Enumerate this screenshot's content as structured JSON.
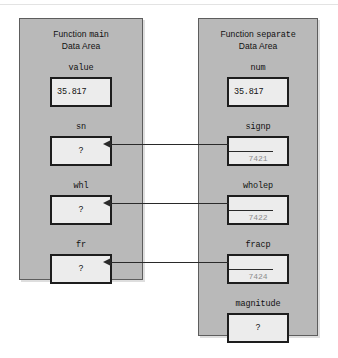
{
  "diagram": {
    "type": "memory-data-area-diagram",
    "panels": [
      {
        "id": "main",
        "title_line1_prefix": "Function ",
        "title_line1_name": "main",
        "title_line2": "Data Area",
        "variables": [
          {
            "name": "value",
            "value": "35.817",
            "address": "",
            "has_incoming_arrow": false
          },
          {
            "name": "sn",
            "value": "?",
            "address": "",
            "has_incoming_arrow": true
          },
          {
            "name": "whl",
            "value": "?",
            "address": "",
            "has_incoming_arrow": true
          },
          {
            "name": "fr",
            "value": "?",
            "address": "",
            "has_incoming_arrow": true
          }
        ]
      },
      {
        "id": "separate",
        "title_line1_prefix": "Function ",
        "title_line1_name": "separate",
        "title_line2": "Data Area",
        "variables": [
          {
            "name": "num",
            "value": "35.817",
            "address": "",
            "has_outgoing_arrow": false
          },
          {
            "name": "signp",
            "value": "",
            "address": "7421",
            "has_outgoing_arrow": true
          },
          {
            "name": "wholep",
            "value": "",
            "address": "7422",
            "has_outgoing_arrow": true
          },
          {
            "name": "fracp",
            "value": "",
            "address": "7424",
            "has_outgoing_arrow": true
          },
          {
            "name": "magnitude",
            "value": "?",
            "address": "",
            "has_outgoing_arrow": false
          }
        ]
      }
    ],
    "pointer_links": [
      {
        "from": "signp",
        "to": "sn",
        "address": "7421"
      },
      {
        "from": "wholep",
        "to": "whl",
        "address": "7422"
      },
      {
        "from": "fracp",
        "to": "fr",
        "address": "7424"
      }
    ],
    "colors": {
      "panel_fill": "#b9b9b9",
      "panel_border": "#5d5d5d",
      "box_fill": "#ececec",
      "box_border": "#1d1d1d",
      "text": "#111111",
      "address_text": "#8d8d8d",
      "arrow": "#2a2a2a",
      "background": "#ffffff"
    }
  }
}
